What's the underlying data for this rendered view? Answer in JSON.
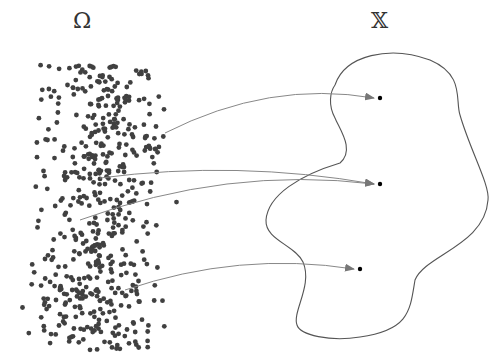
{
  "labels": {
    "sample_space": "Ω",
    "target_space": "𝕏"
  },
  "colors": {
    "dots": "#404040",
    "arrows": "#888888",
    "region_outline": "#555555",
    "target_points": "#000000",
    "background": "#ffffff"
  },
  "sample_cloud": {
    "x_range": [
      15,
      185
    ],
    "y_range": [
      65,
      350
    ],
    "dot_count": 520,
    "dot_radius": 2.4
  },
  "mappings": [
    {
      "from": [
        165,
        133
      ],
      "to": [
        380,
        98
      ]
    },
    {
      "from": [
        100,
        178
      ],
      "to": [
        380,
        184
      ]
    },
    {
      "from": [
        80,
        220
      ],
      "to": [
        380,
        184
      ]
    },
    {
      "from": [
        125,
        290
      ],
      "to": [
        360,
        269
      ]
    }
  ],
  "region_path": "M 335 85 C 345 55, 390 45, 430 60 C 465 75, 455 100, 460 115 C 470 150, 490 185, 488 200 C 485 245, 425 255, 415 280 C 410 310, 410 330, 360 337 C 330 342, 300 335, 297 325 C 292 312, 313 285, 303 262 C 295 245, 265 240, 266 220 C 268 195, 300 175, 340 163 C 355 150, 340 130, 335 118 C 328 105, 330 92, 335 85 Z"
}
